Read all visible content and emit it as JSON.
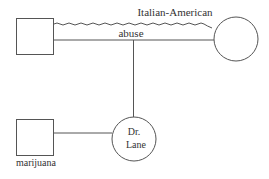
{
  "diagram": {
    "type": "genogram",
    "nodes": [
      {
        "id": "top-male",
        "shape": "square",
        "label": ""
      },
      {
        "id": "top-female",
        "shape": "circle",
        "label": ""
      },
      {
        "id": "bottom-male",
        "shape": "square",
        "label": "marijuana"
      },
      {
        "id": "dr-lane",
        "shape": "circle",
        "label_line1": "Dr.",
        "label_line2": "Lane"
      }
    ],
    "relations": [
      {
        "from": "top-male",
        "to": "top-female",
        "style": "wavy",
        "label": "Italian-American"
      },
      {
        "from": "top-male",
        "to": "top-female",
        "style": "straight",
        "label": "abuse"
      },
      {
        "from": "couple-line",
        "to": "dr-lane",
        "style": "straight",
        "label": ""
      },
      {
        "from": "bottom-male",
        "to": "dr-lane",
        "style": "straight",
        "label": ""
      }
    ],
    "colors": {
      "stroke": "#555555",
      "text": "#333333"
    }
  }
}
